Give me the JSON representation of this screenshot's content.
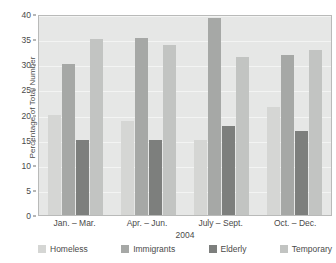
{
  "chart_data": {
    "type": "bar",
    "title": "",
    "xlabel": "2004",
    "ylabel": "Percentage of Total Number",
    "categories": [
      "Jan. – Mar.",
      "Apr. – Jun.",
      "July – Sept.",
      "Oct. – Dec."
    ],
    "series": [
      {
        "name": "Homeless",
        "color": "#d5d6d4",
        "values": [
          20,
          18.8,
          15,
          21.5
        ]
      },
      {
        "name": "Immigrants",
        "color": "#a6a8a6",
        "values": [
          30,
          35.2,
          39.2,
          31.8
        ]
      },
      {
        "name": "Elderly",
        "color": "#7d7f7d",
        "values": [
          15,
          15,
          17.8,
          16.8
        ]
      },
      {
        "name": "Temporary",
        "color": "#c2c4c2",
        "values": [
          35,
          33.8,
          31.5,
          32.8
        ]
      }
    ],
    "ylim": [
      0,
      40
    ],
    "yticks": [
      0,
      5,
      10,
      15,
      20,
      25,
      30,
      35,
      40
    ],
    "ytick_labels": [
      "0",
      "5",
      "10",
      "15",
      "20",
      "25",
      "30",
      "35",
      "40"
    ],
    "grid": true,
    "legend_position": "bottom",
    "plot_background": "#e6e7e6"
  }
}
